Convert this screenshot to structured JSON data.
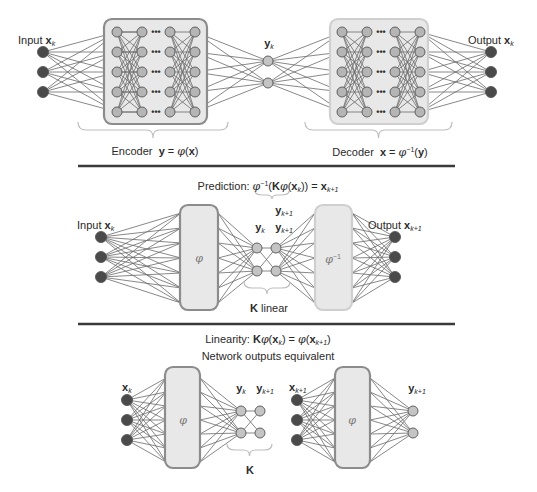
{
  "colors": {
    "input_node": "#4a4a4a",
    "hidden_node": "#b5b5b5",
    "latent_node": "#c4c4c4",
    "box_fill": "#e8e8e8",
    "encoder_border": "#8c8c8c",
    "decoder_border": "#cfcfcf",
    "edge": "#6a6a6a",
    "separator": "#3a3a3a",
    "brace": "#bdbdbd"
  },
  "top": {
    "input_label": "Input",
    "input_var": "x",
    "input_sub": "k",
    "latent_var": "y",
    "latent_sub": "k",
    "output_label": "Output",
    "output_var": "x",
    "output_sub": "k",
    "encoder_label": "Encoder",
    "encoder_eq_lhs": "y",
    "encoder_eq_mid": " = ",
    "encoder_eq_fn": "φ",
    "encoder_eq_arg": "x",
    "decoder_label": "Decoder",
    "decoder_eq_lhs": "x",
    "decoder_eq_mid": " = ",
    "decoder_eq_fn": "φ",
    "decoder_eq_sup": "−1",
    "decoder_eq_arg": "y",
    "ellipsis": "•••"
  },
  "middle": {
    "title_prefix": "Prediction: ",
    "title_fn": "φ",
    "title_sup": "−1",
    "title_K": "K",
    "title_inner_fn": "φ",
    "title_x": "x",
    "title_sub_k": "k",
    "title_eq": " = ",
    "title_rhs": "x",
    "title_rhs_sub": "k+1",
    "input_label": "Input",
    "input_var": "x",
    "input_sub": "k",
    "phi_label": "φ",
    "phi_inv_label": "φ",
    "phi_inv_sup": "−1",
    "yk_var": "y",
    "yk_sub": "k",
    "yk1_var": "y",
    "yk1_sub": "k+1",
    "yk1_top_var": "y",
    "yk1_top_sub": "k+1",
    "k_label": "K",
    "k_suffix": " linear",
    "output_label": "Output",
    "output_var": "x",
    "output_sub": "k+1"
  },
  "bottom": {
    "title_prefix": "Linearity: ",
    "title_K": "K",
    "title_fn": "φ",
    "title_x": "x",
    "title_sub_k": "k",
    "title_eq": " = ",
    "title_rhs_fn": "φ",
    "title_rhs_x": "x",
    "title_rhs_sub": "k+1",
    "subtitle": "Network outputs equivalent",
    "left_input_var": "x",
    "left_input_sub": "k",
    "left_phi": "φ",
    "yk_var": "y",
    "yk_sub": "k",
    "yk1_var": "y",
    "yk1_sub": "k+1",
    "k_label": "K",
    "right_input_var": "x",
    "right_input_sub": "k+1",
    "right_phi": "φ",
    "right_output_var": "y",
    "right_output_sub": "k+1"
  }
}
